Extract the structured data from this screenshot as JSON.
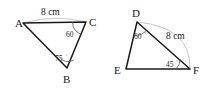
{
  "figure": {
    "background_color": "#ffffff",
    "stroke_color": "#1b1b1b",
    "guide_color": "#b9b9b9",
    "width": 210,
    "height": 88
  },
  "triangles": [
    {
      "id": "triangle-abc",
      "name": "Triangle ABC",
      "vertices": [
        {
          "label": "A",
          "x": 23,
          "y": 23,
          "label_x": 15,
          "label_y": 27
        },
        {
          "label": "C",
          "x": 86,
          "y": 22,
          "label_x": 89,
          "label_y": 26
        },
        {
          "label": "B",
          "x": 67,
          "y": 68,
          "label_x": 64,
          "label_y": 82
        }
      ],
      "side_labels": [
        {
          "text": "8 cm",
          "x": 41,
          "y": 15,
          "side": "AC"
        }
      ],
      "angle_labels": [
        {
          "text": "60",
          "degree": "°",
          "x": 68,
          "y": 36,
          "vertex": "C",
          "value": 60
        },
        {
          "text": "75",
          "degree": "°",
          "x": 56,
          "y": 60,
          "vertex": "B",
          "value": 75
        }
      ]
    },
    {
      "id": "triangle-def",
      "name": "Triangle DEF",
      "vertices": [
        {
          "label": "D",
          "x": 137,
          "y": 22,
          "label_x": 133,
          "label_y": 16
        },
        {
          "label": "E",
          "x": 126,
          "y": 69,
          "label_x": 115,
          "label_y": 74
        },
        {
          "label": "F",
          "x": 190,
          "y": 69,
          "label_x": 193,
          "label_y": 74
        }
      ],
      "side_labels": [
        {
          "text": "8 cm",
          "x": 166,
          "y": 38,
          "side": "DF"
        }
      ],
      "angle_labels": [
        {
          "text": "60",
          "degree": "°",
          "x": 136,
          "y": 38,
          "vertex": "D",
          "value": 60
        },
        {
          "text": "45",
          "degree": "°",
          "x": 167,
          "y": 66,
          "vertex": "F",
          "value": 45
        }
      ]
    }
  ],
  "accessibility": {
    "caption": "Two triangles: triangle A B C with side A C of 8 cm, angle C of 60 degrees and angle B of 75 degrees; triangle D E F with side D F of 8 cm, angle D of 60 degrees and angle F of 45 degrees."
  }
}
